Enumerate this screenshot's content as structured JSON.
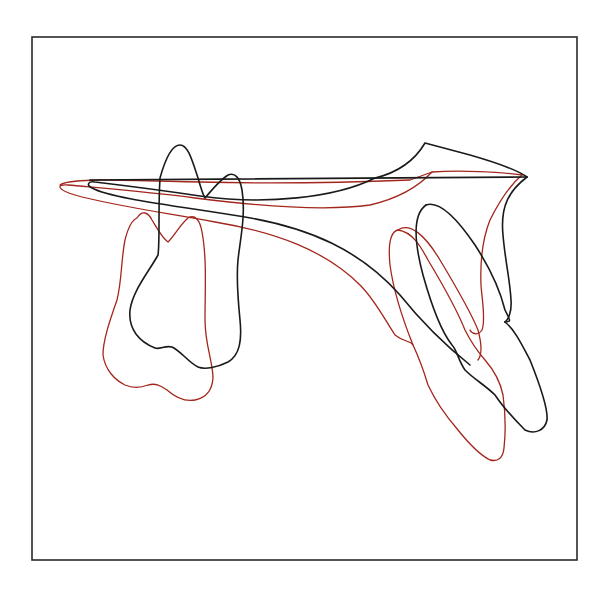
{
  "figure": {
    "type": "cephalometric-superimposition",
    "frame": {
      "x": 32,
      "y": 37,
      "width": 545,
      "height": 523,
      "color": "#2a2a2a"
    },
    "colors": {
      "before": "#1a1a1a",
      "after": "#a3261c",
      "background": "#ffffff"
    },
    "legend": []
  },
  "traces": {
    "black": {
      "palatal_plane": "M90,180 L527,177",
      "maxilla_body": "M527,177 Q515,168 470,155 L425,143 C415,160 400,172 375,178 C335,198 265,205 200,196 C160,190 120,185 95,182 C88,181 86,185 92,188 C110,198 170,205 245,217 C310,228 360,250 400,295 C420,320 445,345 470,365",
      "maxilla_posterior_up": "M527,177 C510,190 500,205 503,235 C505,260 510,280 511,300 C512,312 508,320 505,322",
      "molar": "M160,178 C165,160 172,145 180,145 C188,145 192,160 198,178 C200,185 203,195 205,198 C210,192 220,180 228,175 C235,172 240,178 242,190 C246,215 240,240 238,260 C236,280 238,300 240,320 C242,340 240,355 228,362 C218,367 205,370 198,367 C188,362 182,352 172,347 C165,345 160,350 155,348 C140,342 128,330 130,310 C133,290 150,270 158,255 C160,240 158,210 160,178",
      "incisor_root": "M426,205 C440,200 458,220 475,245 C490,268 500,290 505,310 C510,320 512,322 505,322",
      "incisor": "M505,322 C515,330 522,345 530,360 C540,385 548,410 547,420 C545,430 535,435 525,430 C515,420 505,410 495,395 C485,385 475,380 465,370 C458,360 457,350 452,345 C440,330 430,300 423,275 C415,245 412,215 426,205"
    },
    "red": {
      "palatal_plane": "M60,185 C70,178 110,180 200,182 C280,184 360,182 410,180 L432,172 C460,170 500,172 522,175",
      "maxilla_body": "M522,175 C510,185 500,200 490,220 C482,240 480,260 481,285 C482,300 486,320 482,330 C478,336 472,334 470,330",
      "maxilla_lower": "M432,172 C420,185 400,198 370,205 C320,212 250,205 195,198 C150,192 100,188 68,185 C55,184 58,190 75,195 C110,205 160,212 215,222 C275,232 325,250 360,285 C375,300 385,320 395,335 C405,343 410,340 413,345",
      "molar": "M137,218 C142,210 148,212 152,220 C157,228 162,238 168,242 C174,236 180,225 188,218 C195,214 200,220 202,232 C207,258 205,290 205,320 C205,345 213,362 213,378 C212,392 205,398 195,400 C185,402 175,397 167,390 C160,385 155,383 148,385 C140,388 132,388 125,385 C115,380 105,370 103,355 C103,340 110,320 117,300 C122,280 121,260 125,240 C128,228 132,220 137,218",
      "incisor_root": "M398,230 C410,222 425,235 440,260 C455,285 470,310 478,330 C482,345 482,355 478,360",
      "incisor": "M413,345 C420,360 425,375 428,385 C435,400 445,415 458,430 C470,445 480,455 490,460 C498,462 503,458 504,448 C506,430 505,410 503,395 C500,380 492,368 485,360 C478,352 470,340 465,330 C455,305 440,280 428,260 C420,245 412,232 398,230 C390,232 388,245 390,265 C394,295 405,325 413,345"
    }
  }
}
